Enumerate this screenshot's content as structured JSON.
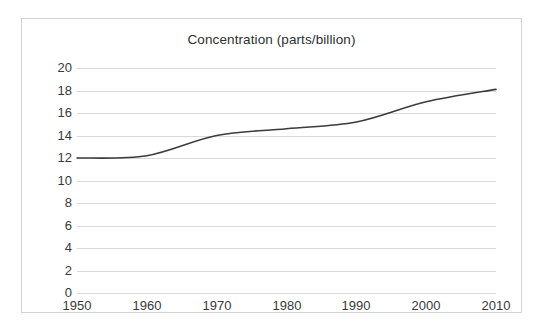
{
  "chart_data": {
    "type": "line",
    "title": "Concentration (parts/billion)",
    "xlabel": "",
    "ylabel": "",
    "x": [
      1950,
      1960,
      1970,
      1980,
      1990,
      2000,
      2010
    ],
    "values": [
      12.0,
      12.2,
      14.0,
      14.6,
      15.2,
      17.0,
      18.1
    ],
    "series": [
      {
        "name": "Concentration",
        "values": [
          12.0,
          12.2,
          14.0,
          14.6,
          15.2,
          17.0,
          18.1
        ],
        "color": "#3b3b3b"
      }
    ],
    "x_tick_labels": [
      "1950",
      "1960",
      "1970",
      "1980",
      "1990",
      "2000",
      "2010"
    ],
    "y_tick_labels": [
      "20",
      "18",
      "16",
      "14",
      "12",
      "10",
      "8",
      "6",
      "4",
      "2",
      "0"
    ],
    "y_tick_values": [
      20,
      18,
      16,
      14,
      12,
      10,
      8,
      6,
      4,
      2,
      0
    ],
    "xlim": [
      1950,
      2010
    ],
    "ylim": [
      0,
      20
    ],
    "grid": true,
    "grid_axis": "y",
    "grid_color": "#d9d9d9",
    "legend": false,
    "legend_position": "none",
    "border_color": "#d2d2d2",
    "background_color": "#ffffff",
    "text_color": "#3a3a3a",
    "line_width": 1.6
  }
}
